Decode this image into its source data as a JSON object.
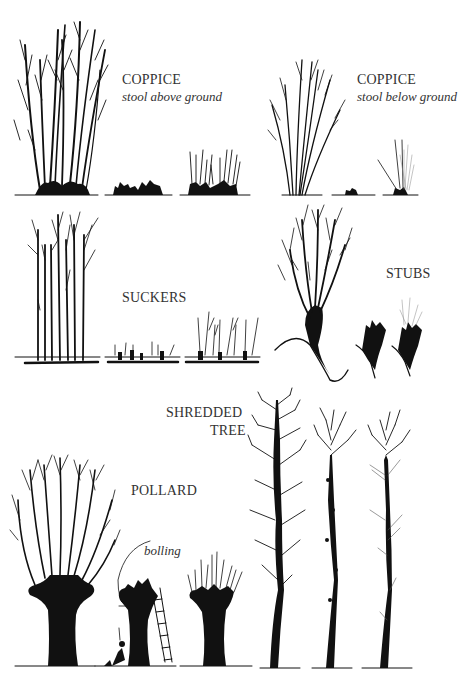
{
  "figure": {
    "panels": [
      {
        "id": "coppice-above",
        "label": "COPPICE",
        "sublabel": "stool above ground",
        "stages": [
          "grown",
          "cut",
          "regrowth"
        ]
      },
      {
        "id": "coppice-below",
        "label": "COPPICE",
        "sublabel": "stool below ground",
        "stages": [
          "grown",
          "cut",
          "regrowth"
        ]
      },
      {
        "id": "suckers",
        "label": "SUCKERS",
        "stages": [
          "grown",
          "cut",
          "regrowth"
        ]
      },
      {
        "id": "stubs",
        "label": "STUBS",
        "stages": [
          "grown",
          "cut",
          "regrowth"
        ]
      },
      {
        "id": "pollard",
        "label": "POLLARD",
        "annotation": "bolling",
        "stages": [
          "grown",
          "cut",
          "regrowth"
        ]
      },
      {
        "id": "shredded",
        "label_line1": "SHREDDED",
        "label_line2": "TREE",
        "stages": [
          "grown",
          "cut",
          "regrowth"
        ]
      }
    ]
  },
  "colors": {
    "ink": "#111111",
    "text": "#333333",
    "background": "#ffffff"
  }
}
